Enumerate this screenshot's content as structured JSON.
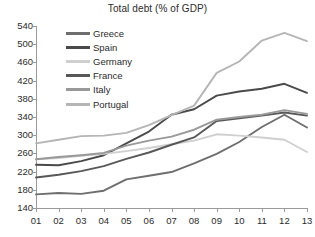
{
  "chart_data": {
    "type": "line",
    "title": "Total debt (% of GDP)",
    "xlabel": "",
    "ylabel": "",
    "x": [
      "01",
      "02",
      "03",
      "04",
      "05",
      "06",
      "07",
      "08",
      "09",
      "10",
      "11",
      "12",
      "13"
    ],
    "xlim": [
      0,
      12
    ],
    "ylim": [
      140,
      540
    ],
    "ytick_step": 40,
    "yticks": [
      140,
      180,
      220,
      260,
      300,
      340,
      380,
      420,
      460,
      500,
      540
    ],
    "grid": false,
    "legend_position": "top-left-inside",
    "series": [
      {
        "name": "Greece",
        "color": "#6e6e6e",
        "values": [
          170,
          173,
          171,
          178,
          203,
          211,
          219,
          238,
          259,
          285,
          318,
          345,
          317
        ]
      },
      {
        "name": "Spain",
        "color": "#4a4a4a",
        "values": [
          235,
          234,
          243,
          256,
          282,
          308,
          345,
          357,
          387,
          396,
          402,
          413,
          393
        ]
      },
      {
        "name": "Germany",
        "color": "#cfcfcf",
        "values": [
          247,
          250,
          255,
          259,
          265,
          272,
          280,
          288,
          302,
          299,
          295,
          290,
          263
        ]
      },
      {
        "name": "France",
        "color": "#585858",
        "values": [
          207,
          213,
          221,
          232,
          248,
          262,
          279,
          295,
          331,
          337,
          343,
          350,
          343
        ]
      },
      {
        "name": "Italy",
        "color": "#999999",
        "values": [
          247,
          252,
          256,
          261,
          277,
          288,
          297,
          312,
          334,
          340,
          345,
          355,
          347
        ]
      },
      {
        "name": "Portugal",
        "color": "#b5b5b5",
        "values": [
          282,
          290,
          298,
          299,
          305,
          322,
          344,
          365,
          437,
          462,
          508,
          525,
          507
        ]
      }
    ]
  },
  "legend": {
    "items": [
      {
        "label": "Greece"
      },
      {
        "label": "Spain"
      },
      {
        "label": "Germany"
      },
      {
        "label": "France"
      },
      {
        "label": "Italy"
      },
      {
        "label": "Portugal"
      }
    ]
  }
}
